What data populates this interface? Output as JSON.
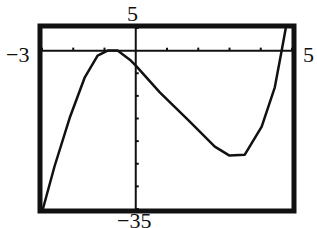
{
  "window_labels": {
    "xmin": "−3",
    "xmax": "5",
    "ymin": "−35",
    "ymax": "5"
  },
  "chart_data": {
    "type": "line",
    "title": "",
    "xlabel": "",
    "ylabel": "",
    "xlim": [
      -3,
      5
    ],
    "ylim": [
      -35,
      5
    ],
    "x_tick_step": 1,
    "y_tick_step": 5,
    "grid": false,
    "legend": null,
    "series": [
      {
        "name": "f(x)",
        "x": [
          -2.97,
          -2.6,
          -2.1,
          -1.63,
          -1.22,
          -0.9,
          -0.58,
          -0.19,
          0.0,
          0.77,
          1.73,
          2.53,
          3.0,
          3.49,
          4.03,
          4.45,
          4.67,
          4.8
        ],
        "y": [
          -35,
          -25.6,
          -14.6,
          -5.9,
          -1.1,
          0,
          0,
          -2,
          -3.3,
          -9.2,
          -15.7,
          -21.2,
          -23.2,
          -23.0,
          -16.8,
          -8.1,
          0,
          5
        ]
      }
    ],
    "annotations": [
      "local maximum near (-1, 0)",
      "local minimum near (3, -23)"
    ]
  },
  "colors": {
    "frame": "#111111",
    "curve": "#111111",
    "background": "#ffffff"
  }
}
